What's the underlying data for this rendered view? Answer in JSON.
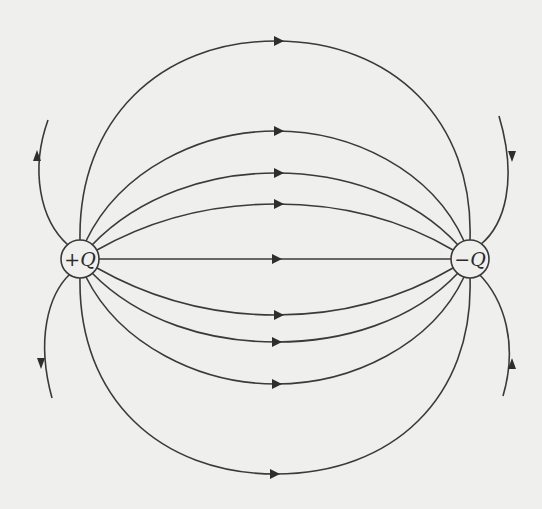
{
  "diagram": {
    "charges": [
      {
        "id": "positive",
        "sign": "+",
        "symbol": "Q",
        "label": "+Q",
        "cx": 80,
        "cy": 259,
        "r": 19
      },
      {
        "id": "negative",
        "sign": "−",
        "symbol": "Q",
        "label": "−Q",
        "cx": 470,
        "cy": 259,
        "r": 19
      }
    ],
    "field_lines": [
      {
        "name": "top-outer",
        "apex_y": 41,
        "arrow_x": 280
      },
      {
        "name": "upper-2",
        "apex_y": 131,
        "arrow_x": 280
      },
      {
        "name": "upper-3",
        "apex_y": 173,
        "arrow_x": 280
      },
      {
        "name": "upper-4",
        "apex_y": 204,
        "arrow_x": 280
      },
      {
        "name": "center",
        "apex_y": 259,
        "arrow_x": 278
      },
      {
        "name": "lower-4",
        "apex_y": 315,
        "arrow_x": 280
      },
      {
        "name": "lower-3",
        "apex_y": 342,
        "arrow_x": 278
      },
      {
        "name": "lower-2",
        "apex_y": 384,
        "arrow_x": 278
      },
      {
        "name": "bottom-outer",
        "apex_y": 474,
        "arrow_x": 276
      }
    ],
    "escaping_lines": [
      {
        "name": "left-upper",
        "direction": "away-from-positive"
      },
      {
        "name": "left-lower",
        "direction": "away-from-positive"
      },
      {
        "name": "right-upper",
        "direction": "toward-negative"
      },
      {
        "name": "right-lower",
        "direction": "toward-negative"
      }
    ],
    "colors": {
      "line": "#3a3a3a",
      "background": "#efefed"
    }
  }
}
